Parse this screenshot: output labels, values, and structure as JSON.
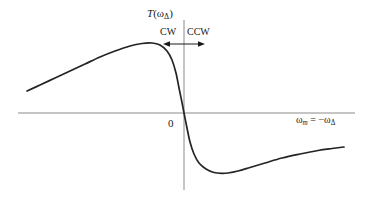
{
  "figure": {
    "kind": "line-plot",
    "background_color": "#ffffff",
    "axis_color": "#8a8a8a",
    "curve_color": "#242424",
    "text_color": "#1a1a1a",
    "width": 367,
    "height": 208
  },
  "labels": {
    "y_axis_label": "T(ω_Δ)",
    "y_axis_label_parts": {
      "fn": "T",
      "open": "(",
      "omega": "ω",
      "sub": "Δ",
      "close": ")"
    },
    "x_axis_label": "ω_m = -ω_Δ",
    "x_axis_label_parts": {
      "omega1": "ω",
      "sub1": "m",
      "equals": " = −",
      "omega2": "ω",
      "sub2": "Δ"
    },
    "origin_label": "0",
    "direction_left": "CW",
    "direction_right": "CCW"
  },
  "annotations": {
    "arrow_left_name": "cw-arrow",
    "arrow_right_name": "ccw-arrow",
    "arrow_y": 44,
    "arrow_left_from_x": 184,
    "arrow_left_to_x": 165,
    "arrow_right_from_x": 184,
    "arrow_right_to_x": 203
  },
  "chart_data": {
    "type": "line",
    "title": "",
    "xlabel": "ω_m = -ω_Δ",
    "ylabel": "T(ω_Δ)",
    "grid": false,
    "legend": null,
    "axes": {
      "x_axis_y_pixel": 113,
      "x_axis_x_start_pixel": 18,
      "x_axis_x_end_pixel": 355,
      "y_axis_x_pixel": 184,
      "y_axis_y_top_pixel": 20,
      "y_axis_y_bottom_pixel": 190,
      "origin_pixel": [
        184,
        113
      ]
    },
    "features": {
      "zero_crossing_x": 0,
      "maximum_pixel": [
        152,
        43
      ],
      "minimum_pixel": [
        228,
        173
      ],
      "left_endpoint_pixel": [
        27,
        91
      ],
      "right_endpoint_pixel": [
        344,
        147
      ],
      "shape": "dispersive antisymmetric resonance lineshape"
    },
    "series": [
      {
        "name": "T(omega_delta)",
        "description": "Dispersive (derivative-of-Lorentzian) curve: rises from left tail to a positive maximum just left of the origin, crosses zero steeply at the origin, falls to a negative minimum just right of the origin, then relaxes back toward zero.",
        "points_pixel": [
          [
            27,
            91
          ],
          [
            40,
            85
          ],
          [
            55,
            78
          ],
          [
            70,
            71
          ],
          [
            85,
            64
          ],
          [
            100,
            57
          ],
          [
            115,
            51
          ],
          [
            130,
            46
          ],
          [
            142,
            43.5
          ],
          [
            152,
            43
          ],
          [
            160,
            45
          ],
          [
            167,
            51
          ],
          [
            172,
            60
          ],
          [
            176,
            73
          ],
          [
            179,
            88
          ],
          [
            181.5,
            100
          ],
          [
            184,
            113
          ],
          [
            187,
            128
          ],
          [
            190,
            142
          ],
          [
            194,
            154
          ],
          [
            199,
            163
          ],
          [
            206,
            169
          ],
          [
            214,
            172.5
          ],
          [
            222,
            173.4
          ],
          [
            228,
            173
          ],
          [
            238,
            171
          ],
          [
            250,
            167.5
          ],
          [
            265,
            163
          ],
          [
            282,
            158
          ],
          [
            300,
            154
          ],
          [
            318,
            150.5
          ],
          [
            332,
            148.5
          ],
          [
            344,
            147
          ]
        ]
      }
    ]
  }
}
